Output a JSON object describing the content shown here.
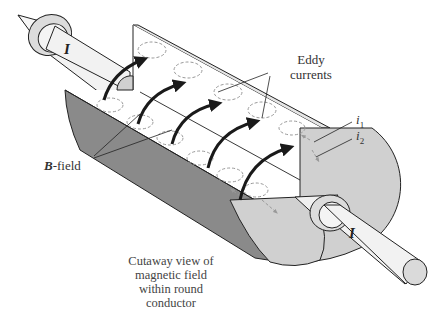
{
  "diagram": {
    "title": "Cutaway view of magnetic field within round conductor",
    "caption_lines": [
      "Cutaway view of",
      "magnetic field",
      "within round",
      "conductor"
    ],
    "labels": {
      "current_left": "I",
      "current_right": "I",
      "eddy_line1": "Eddy",
      "eddy_line2": "currents",
      "i1_base": "i",
      "i1_sub": "1",
      "i2_base": "i",
      "i2_sub": "2",
      "bfield_symbol": "B",
      "bfield_suffix": "-field"
    },
    "colors": {
      "outline": "#222222",
      "cut_face": "#d0d0d0",
      "outer_surface": "#8a8a8a",
      "inner_surface": "#ffffff",
      "field_arrow": "#1a1a1a",
      "eddy_dashed": "#999999",
      "rod": "#f2f2f2"
    }
  }
}
